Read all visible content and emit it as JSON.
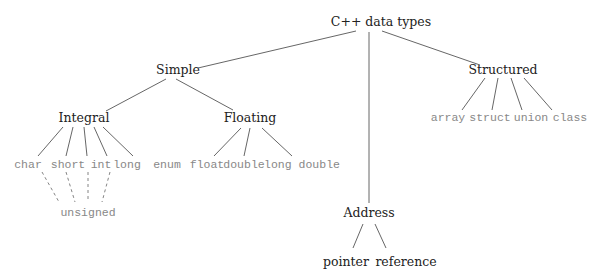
{
  "diagram": {
    "title": "C++ data types",
    "root": "C++ data types",
    "categories": {
      "simple": "Simple",
      "structured": "Structured",
      "address": "Address"
    },
    "simple": {
      "integral": "Integral",
      "floating": "Floating"
    },
    "integral_types": [
      "char",
      "short",
      "int",
      "long",
      "enum"
    ],
    "floating_types": [
      "float",
      "double",
      "long double"
    ],
    "structured_types": [
      "array",
      "struct",
      "union",
      "class"
    ],
    "address_types": [
      "pointer",
      "reference"
    ],
    "modifier": "unsigned",
    "modifier_applies_to": [
      "char",
      "short",
      "int",
      "long"
    ],
    "colors": {
      "node_text": "#222222",
      "leaf_text": "#888888",
      "edge": "#555555",
      "dashed_edge": "#777777"
    }
  }
}
